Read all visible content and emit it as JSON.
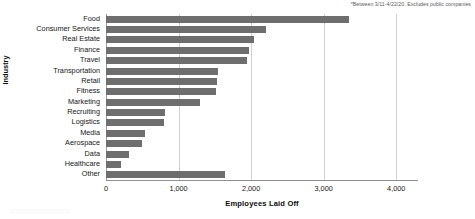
{
  "footnote": "*Between 3/11-4/22/20. Excludes public companies",
  "axes": {
    "xlabel": "Employees Laid Off",
    "ylabel": "Industry",
    "xticks": [
      "0",
      "1,000",
      "2,000",
      "3,000",
      "4,000"
    ]
  },
  "chart_data": {
    "type": "bar",
    "orientation": "horizontal",
    "title": "",
    "subtitle": "",
    "xlabel": "Employees Laid Off",
    "ylabel": "Industry",
    "xlim": [
      0,
      4300
    ],
    "xticks": [
      0,
      1000,
      2000,
      3000,
      4000
    ],
    "xticklabels": [
      "0",
      "1,000",
      "2,000",
      "3,000",
      "4,000"
    ],
    "grid": "vertical",
    "legend": "none",
    "bar_color": "#6e6e6e",
    "annotations": [
      "*Between 3/11-4/22/20. Excludes public companies"
    ],
    "categories": [
      "Food",
      "Consumer Services",
      "Real Estate",
      "Finance",
      "Travel",
      "Transportation",
      "Retail",
      "Fitness",
      "Marketing",
      "Recruiting",
      "Logistics",
      "Media",
      "Aerospace",
      "Data",
      "Healthcare",
      "Other"
    ],
    "values": [
      3350,
      2200,
      2040,
      1970,
      1950,
      1540,
      1530,
      1520,
      1300,
      820,
      800,
      540,
      490,
      320,
      200,
      1640
    ]
  }
}
